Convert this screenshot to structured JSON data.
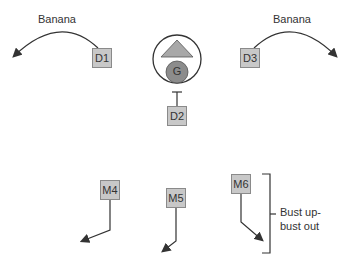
{
  "labels": {
    "left_arc": "Banana",
    "right_arc": "Banana",
    "center": "G",
    "bracket_line1": "Bust up-",
    "bracket_line2": "bust out"
  },
  "boxes": {
    "d1": "D1",
    "d2": "D2",
    "d3": "D3",
    "m4": "M4",
    "m5": "M5",
    "m6": "M6"
  },
  "colors": {
    "box_fill": "#c8c8c8",
    "triangle_fill": "#a8a8a8",
    "circle_fill": "#8c8c8c",
    "line": "#333333"
  }
}
